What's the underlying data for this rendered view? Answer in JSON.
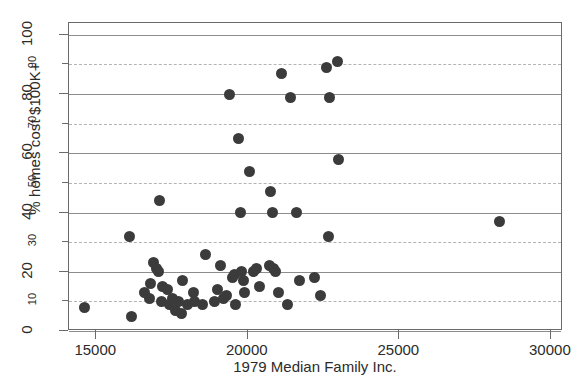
{
  "chart_data": {
    "type": "scatter",
    "title": "",
    "xlabel": "1979 Median Family Inc.",
    "ylabel": "% homes cost $100K+",
    "xlim": [
      14100,
      30400
    ],
    "ylim": [
      0,
      104
    ],
    "grid": true,
    "legend_position": "none",
    "x_major_ticks": [
      15000,
      20000,
      25000,
      30000
    ],
    "x_tick_labels": [
      "15000",
      "20000",
      "25000",
      "30000"
    ],
    "y_major_ticks": [
      0,
      20,
      40,
      60,
      80,
      100
    ],
    "y_major_tick_labels": [
      "0",
      "20",
      "40",
      "60",
      "80",
      "100"
    ],
    "y_minor_ticks": [
      10,
      30,
      50,
      70,
      90
    ],
    "y_minor_tick_labels": [
      "10",
      "30",
      "50",
      "70",
      "90"
    ],
    "marker": "filled-circle",
    "marker_color": "#3b3b3b",
    "points": [
      {
        "x": 14600,
        "y": 8
      },
      {
        "x": 16100,
        "y": 32
      },
      {
        "x": 16150,
        "y": 5
      },
      {
        "x": 16600,
        "y": 13
      },
      {
        "x": 16750,
        "y": 11
      },
      {
        "x": 16800,
        "y": 16
      },
      {
        "x": 16900,
        "y": 23
      },
      {
        "x": 17000,
        "y": 21
      },
      {
        "x": 17050,
        "y": 20
      },
      {
        "x": 17100,
        "y": 44
      },
      {
        "x": 17150,
        "y": 10
      },
      {
        "x": 17200,
        "y": 15
      },
      {
        "x": 17350,
        "y": 14
      },
      {
        "x": 17400,
        "y": 9
      },
      {
        "x": 17500,
        "y": 11
      },
      {
        "x": 17600,
        "y": 7
      },
      {
        "x": 17700,
        "y": 10
      },
      {
        "x": 17800,
        "y": 6
      },
      {
        "x": 17850,
        "y": 17
      },
      {
        "x": 18000,
        "y": 9
      },
      {
        "x": 18200,
        "y": 13
      },
      {
        "x": 18250,
        "y": 10
      },
      {
        "x": 18500,
        "y": 9
      },
      {
        "x": 18600,
        "y": 26
      },
      {
        "x": 18900,
        "y": 10
      },
      {
        "x": 19000,
        "y": 14
      },
      {
        "x": 19100,
        "y": 22
      },
      {
        "x": 19200,
        "y": 11
      },
      {
        "x": 19300,
        "y": 12
      },
      {
        "x": 19400,
        "y": 80
      },
      {
        "x": 19500,
        "y": 18
      },
      {
        "x": 19550,
        "y": 19
      },
      {
        "x": 19600,
        "y": 9
      },
      {
        "x": 19700,
        "y": 65
      },
      {
        "x": 19750,
        "y": 40
      },
      {
        "x": 19800,
        "y": 20
      },
      {
        "x": 19850,
        "y": 17
      },
      {
        "x": 19900,
        "y": 13
      },
      {
        "x": 20050,
        "y": 54
      },
      {
        "x": 20200,
        "y": 20
      },
      {
        "x": 20300,
        "y": 21
      },
      {
        "x": 20400,
        "y": 15
      },
      {
        "x": 20700,
        "y": 22
      },
      {
        "x": 20750,
        "y": 47
      },
      {
        "x": 20800,
        "y": 40
      },
      {
        "x": 20850,
        "y": 21
      },
      {
        "x": 20900,
        "y": 20
      },
      {
        "x": 21000,
        "y": 13
      },
      {
        "x": 21100,
        "y": 87
      },
      {
        "x": 21300,
        "y": 9
      },
      {
        "x": 21400,
        "y": 79
      },
      {
        "x": 21600,
        "y": 40
      },
      {
        "x": 21700,
        "y": 17
      },
      {
        "x": 22200,
        "y": 18
      },
      {
        "x": 22400,
        "y": 12
      },
      {
        "x": 22600,
        "y": 89
      },
      {
        "x": 22650,
        "y": 32
      },
      {
        "x": 22700,
        "y": 79
      },
      {
        "x": 22950,
        "y": 91
      },
      {
        "x": 23000,
        "y": 58
      },
      {
        "x": 28300,
        "y": 37
      }
    ]
  },
  "axis": {
    "x_left_px": 68,
    "x_right_px": 562,
    "y_top_px": 22,
    "y_bottom_px": 330
  }
}
